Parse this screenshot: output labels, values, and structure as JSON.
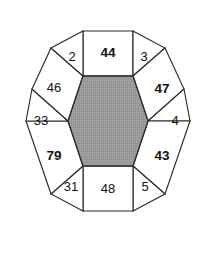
{
  "figure": {
    "name": "decagon-hexagon-number-puzzle",
    "type": "geometric-number-puzzle",
    "background_color": "#ffffff",
    "outline_color": "#2b2b2b",
    "center_shape": {
      "name": "inner-hexagon",
      "sides": 6,
      "fill_color": "#9a9a9a",
      "fill_pattern": "halftone-dither",
      "label": ""
    },
    "outer_shape": {
      "name": "outer-decagon",
      "sides": 10
    },
    "cells": [
      {
        "id": "cell-top",
        "label": "44",
        "bold": true,
        "position": "top",
        "cx": 108,
        "cy": 52,
        "shape": "trapezoid"
      },
      {
        "id": "cell-top-right",
        "label": "3",
        "bold": false,
        "position": "top-right",
        "cx": 146,
        "cy": 57,
        "shape": "triangle"
      },
      {
        "id": "cell-right-upper",
        "label": "47",
        "bold": true,
        "position": "right-upper",
        "cx": 163,
        "cy": 88,
        "shape": "quadrilateral"
      },
      {
        "id": "cell-right",
        "label": "4",
        "bold": false,
        "position": "right",
        "cx": 174,
        "cy": 122,
        "shape": "triangle"
      },
      {
        "id": "cell-right-lower",
        "label": "43",
        "bold": true,
        "position": "right-lower",
        "cx": 163,
        "cy": 155,
        "shape": "quadrilateral"
      },
      {
        "id": "cell-bottom-right",
        "label": "5",
        "bold": false,
        "position": "bottom-right",
        "cx": 146,
        "cy": 187,
        "shape": "triangle"
      },
      {
        "id": "cell-bottom",
        "label": "48",
        "bold": false,
        "position": "bottom",
        "cx": 108,
        "cy": 191,
        "shape": "trapezoid"
      },
      {
        "id": "cell-bottom-left",
        "label": "31",
        "bold": false,
        "position": "bottom-left",
        "cx": 70,
        "cy": 187,
        "shape": "triangle"
      },
      {
        "id": "cell-left-lower",
        "label": "79",
        "bold": true,
        "position": "left-lower",
        "cx": 53,
        "cy": 155,
        "shape": "quadrilateral"
      },
      {
        "id": "cell-left",
        "label": "33",
        "bold": false,
        "position": "left",
        "cx": 42,
        "cy": 122,
        "shape": "triangle"
      },
      {
        "id": "cell-left-upper",
        "label": "46",
        "bold": false,
        "position": "left-upper",
        "cx": 53,
        "cy": 88,
        "shape": "quadrilateral"
      },
      {
        "id": "cell-top-left",
        "label": "2",
        "bold": false,
        "position": "top-left",
        "cx": 70,
        "cy": 57,
        "shape": "triangle"
      }
    ]
  }
}
